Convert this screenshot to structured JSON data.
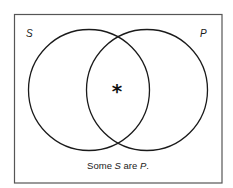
{
  "diagram": {
    "type": "venn",
    "sets": [
      {
        "name": "S",
        "label": "S"
      },
      {
        "name": "P",
        "label": "P"
      }
    ],
    "marker": {
      "symbol": "*",
      "region": "S ∩ P",
      "meaning": "at least one member exists"
    },
    "caption": {
      "prefix": "Some ",
      "subject": "S",
      "middle": " are ",
      "predicate": "P",
      "suffix": "."
    },
    "colors": {
      "stroke": "#1a1a1a",
      "border": "#555555",
      "background": "#ffffff"
    }
  }
}
